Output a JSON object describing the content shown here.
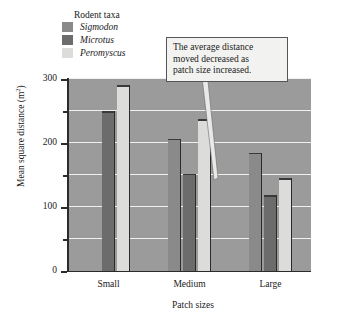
{
  "chart_data": {
    "type": "bar",
    "title": "",
    "xlabel": "Patch sizes",
    "ylabel": "Mean square distance (m²)",
    "categories": [
      "Small",
      "Medium",
      "Large"
    ],
    "ylim": [
      0,
      300
    ],
    "yticks": [
      0,
      100,
      200,
      300
    ],
    "ytick_labels": [
      "0",
      "100",
      "200",
      "300"
    ],
    "yminor_ticks": [
      50,
      150,
      250
    ],
    "grid": "horizontal",
    "legend_title": "Rodent taxa",
    "legend_position": "above-left",
    "series": [
      {
        "name": "Sigmodon",
        "color": "#8a8a8a",
        "values": [
          null,
          207,
          185
        ]
      },
      {
        "name": "Microtus",
        "color": "#6c6c6c",
        "values": [
          250,
          152,
          118
        ]
      },
      {
        "name": "Peromyscus",
        "color": "#dcdcda",
        "values": [
          290,
          237,
          145
        ]
      }
    ],
    "annotations": [
      {
        "text": "The average distance moved decreased as patch size increased.",
        "lines": [
          "The average distance",
          "moved decreased as",
          "patch size increased."
        ],
        "points_to": "Large / Peromyscus bar"
      }
    ],
    "plot_background": "#9b9b9b",
    "gridline_color": "#efefef",
    "axis_color": "#2b2b2b"
  },
  "legend": {
    "title": "Rodent taxa",
    "items": [
      {
        "label": "Sigmodon",
        "color": "#8a8a8a"
      },
      {
        "label": "Microtus",
        "color": "#6c6c6c"
      },
      {
        "label": "Peromyscus",
        "color": "#dcdcda"
      }
    ]
  },
  "axes": {
    "y": {
      "label_main": "Mean square distance (m",
      "label_sup": "2",
      "label_close": ")",
      "ticks": [
        "300",
        "200",
        "100",
        "0"
      ]
    },
    "x": {
      "label": "Patch sizes",
      "ticks": [
        "Small",
        "Medium",
        "Large"
      ]
    }
  },
  "callout": {
    "line1": "The average distance",
    "line2": "moved decreased as",
    "line3": "patch size increased."
  },
  "caption": {
    "text": ""
  }
}
